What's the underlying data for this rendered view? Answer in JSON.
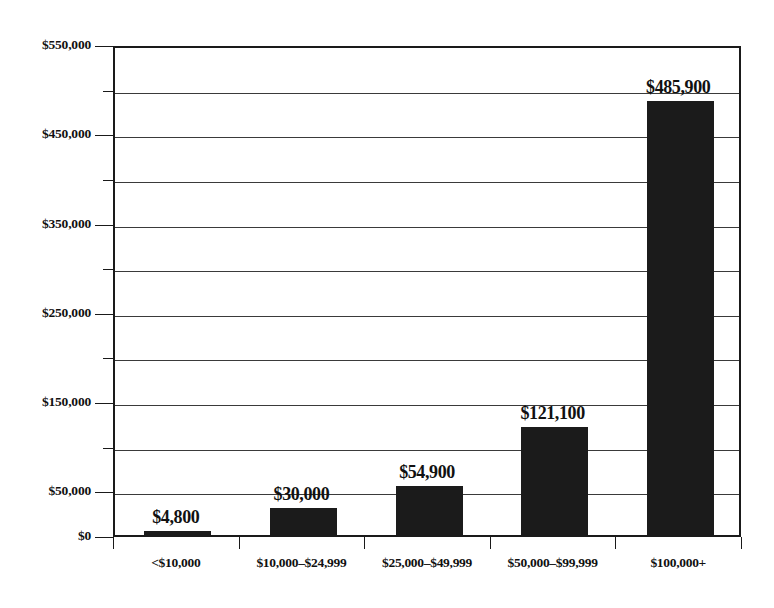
{
  "chart_data": {
    "type": "bar",
    "title": "",
    "subtitle": "",
    "xlabel": "",
    "ylabel": "",
    "categories": [
      "<$10,000",
      "$10,000–$24,999",
      "$25,000–$49,999",
      "$50,000–$99,999",
      "$100,000+"
    ],
    "values": [
      4800,
      30000,
      54900,
      121100,
      485900
    ],
    "value_labels": [
      "$4,800",
      "$30,000",
      "$54,900",
      "$121,100",
      "$485,900"
    ],
    "ylim": [
      0,
      550000
    ],
    "ytick_interval": 50000,
    "ytick_values": [
      0,
      50000,
      100000,
      150000,
      200000,
      250000,
      300000,
      350000,
      400000,
      450000,
      500000,
      550000
    ],
    "ytick_labels": [
      "$0",
      "$50,000",
      "",
      "$150,000",
      "",
      "$250,000",
      "",
      "$350,000",
      "",
      "$450,000",
      "",
      "$550,000"
    ],
    "labeled_ytick_values": [
      0,
      50000,
      150000,
      250000,
      350000,
      450000,
      550000
    ],
    "grid": true,
    "grid_axis": "y",
    "legend": false,
    "legend_position": "none",
    "bar_color": "#1b1b1b",
    "axis_color": "#1a1a1a",
    "grid_color": "#3a3a3a",
    "background_color": "#ffffff"
  },
  "axis": {
    "y_labels": [
      "$550,000",
      "$450,000",
      "$350,000",
      "$250,000",
      "$150,000",
      "$50,000",
      "$0"
    ],
    "x_labels": [
      "<$10,000",
      "$10,000–$24,999",
      "$25,000–$49,999",
      "$50,000–$99,999",
      "$100,000+"
    ]
  },
  "bars": [
    {
      "label": "<$10,000",
      "value_label": "$4,800",
      "value": 4800
    },
    {
      "label": "$10,000–$24,999",
      "value_label": "$30,000",
      "value": 30000
    },
    {
      "label": "$25,000–$49,999",
      "value_label": "$54,900",
      "value": 54900
    },
    {
      "label": "$50,000–$99,999",
      "value_label": "$121,100",
      "value": 121100
    },
    {
      "label": "$100,000+",
      "value_label": "$485,900",
      "value": 485900
    }
  ]
}
